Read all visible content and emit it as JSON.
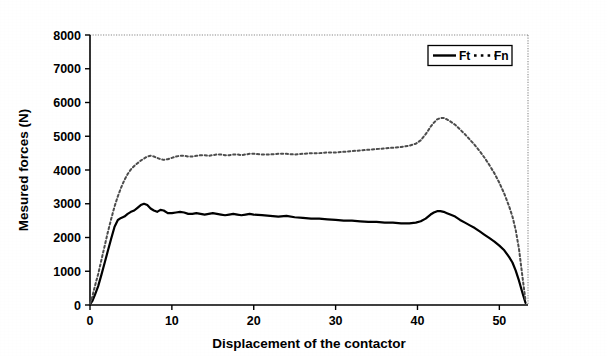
{
  "chart_data": {
    "type": "line",
    "title": "",
    "xlabel": "Displacement of the contactor",
    "ylabel": "Mesured forces (N)",
    "xlim": [
      0,
      53.5
    ],
    "ylim": [
      0,
      8000
    ],
    "xticks": [
      0,
      10,
      20,
      30,
      40,
      50
    ],
    "yticks": [
      0,
      1000,
      2000,
      3000,
      4000,
      5000,
      6000,
      7000,
      8000
    ],
    "xtick_labels": [
      "0",
      "10",
      "20",
      "30",
      "40",
      "50"
    ],
    "ytick_labels": [
      "0",
      "1000",
      "2000",
      "3000",
      "4000",
      "5000",
      "6000",
      "7000",
      "8000"
    ],
    "grid": false,
    "legend_position": "top-right",
    "plot_border": "dotted-top-right",
    "series": [
      {
        "name": "Ft",
        "style": "solid",
        "color": "#000000",
        "width": 2.2,
        "x": [
          0,
          0.3,
          0.6,
          1.0,
          1.4,
          1.8,
          2.2,
          2.6,
          3.0,
          3.4,
          3.8,
          4.2,
          4.6,
          5.0,
          5.4,
          5.8,
          6.2,
          6.6,
          7.0,
          7.4,
          7.8,
          8.2,
          8.6,
          9.0,
          9.5,
          10.0,
          10.5,
          11.0,
          11.5,
          12.0,
          12.5,
          13.0,
          13.5,
          14.0,
          14.5,
          15.0,
          15.5,
          16.0,
          16.5,
          17.0,
          17.5,
          18.0,
          18.5,
          19.0,
          19.5,
          20.0,
          21.0,
          22.0,
          23.0,
          24.0,
          25.0,
          26.0,
          27.0,
          28.0,
          29.0,
          30.0,
          31.0,
          32.0,
          33.0,
          34.0,
          35.0,
          36.0,
          37.0,
          38.0,
          39.0,
          39.8,
          40.4,
          41.0,
          41.6,
          42.0,
          42.4,
          42.8,
          43.2,
          43.6,
          44.0,
          44.6,
          45.2,
          45.8,
          46.4,
          47.0,
          47.6,
          48.2,
          48.8,
          49.4,
          50.0,
          50.6,
          51.2,
          51.6,
          52.0,
          52.4,
          52.8,
          53.2
        ],
        "y": [
          20,
          120,
          300,
          560,
          900,
          1260,
          1620,
          1980,
          2320,
          2520,
          2580,
          2620,
          2700,
          2760,
          2800,
          2880,
          2960,
          3000,
          2960,
          2860,
          2800,
          2760,
          2820,
          2800,
          2720,
          2720,
          2740,
          2760,
          2740,
          2700,
          2700,
          2720,
          2700,
          2680,
          2700,
          2720,
          2700,
          2680,
          2660,
          2680,
          2700,
          2680,
          2660,
          2680,
          2700,
          2680,
          2660,
          2640,
          2620,
          2640,
          2600,
          2580,
          2560,
          2560,
          2540,
          2520,
          2500,
          2500,
          2480,
          2460,
          2460,
          2440,
          2440,
          2420,
          2420,
          2440,
          2480,
          2560,
          2680,
          2740,
          2780,
          2780,
          2760,
          2720,
          2680,
          2620,
          2520,
          2440,
          2360,
          2280,
          2180,
          2080,
          1980,
          1880,
          1760,
          1620,
          1420,
          1260,
          1020,
          720,
          380,
          60
        ]
      },
      {
        "name": "Fn",
        "style": "dotted",
        "color": "#4d4d4d",
        "width": 2.0,
        "x": [
          0,
          0.3,
          0.6,
          1.0,
          1.4,
          1.8,
          2.2,
          2.6,
          3.0,
          3.4,
          3.8,
          4.2,
          4.6,
          5.0,
          5.4,
          5.8,
          6.2,
          6.6,
          7.0,
          7.4,
          7.8,
          8.2,
          8.6,
          9.0,
          9.5,
          10.0,
          10.5,
          11.0,
          11.5,
          12.0,
          12.5,
          13.0,
          13.5,
          14.0,
          14.5,
          15.0,
          15.5,
          16.0,
          16.5,
          17.0,
          17.5,
          18.0,
          18.5,
          19.0,
          19.5,
          20.0,
          21.0,
          22.0,
          23.0,
          24.0,
          25.0,
          26.0,
          27.0,
          28.0,
          29.0,
          30.0,
          31.0,
          32.0,
          33.0,
          34.0,
          35.0,
          36.0,
          37.0,
          38.0,
          39.0,
          39.8,
          40.4,
          41.0,
          41.6,
          42.0,
          42.4,
          42.8,
          43.2,
          43.6,
          44.0,
          44.6,
          45.2,
          45.8,
          46.4,
          47.0,
          47.6,
          48.2,
          48.8,
          49.4,
          50.0,
          50.6,
          51.2,
          51.6,
          52.0,
          52.4,
          52.8,
          53.2
        ],
        "y": [
          40,
          260,
          560,
          920,
          1340,
          1760,
          2180,
          2560,
          2920,
          3220,
          3480,
          3700,
          3880,
          4020,
          4120,
          4200,
          4280,
          4340,
          4400,
          4420,
          4400,
          4360,
          4320,
          4300,
          4320,
          4360,
          4400,
          4420,
          4420,
          4400,
          4400,
          4420,
          4440,
          4440,
          4420,
          4440,
          4460,
          4460,
          4440,
          4440,
          4460,
          4460,
          4440,
          4460,
          4480,
          4480,
          4460,
          4460,
          4480,
          4480,
          4460,
          4480,
          4500,
          4500,
          4520,
          4520,
          4540,
          4560,
          4580,
          4600,
          4620,
          4640,
          4660,
          4680,
          4720,
          4780,
          4880,
          5060,
          5280,
          5400,
          5500,
          5540,
          5540,
          5500,
          5440,
          5340,
          5200,
          5060,
          4900,
          4740,
          4560,
          4360,
          4140,
          3900,
          3620,
          3300,
          2920,
          2620,
          2220,
          1660,
          880,
          120
        ]
      }
    ]
  },
  "legend": {
    "items": [
      {
        "label": "Ft",
        "style": "solid"
      },
      {
        "label": "Fn",
        "style": "dotted"
      }
    ]
  }
}
